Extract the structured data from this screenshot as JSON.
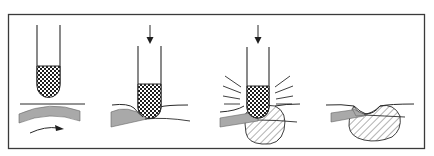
{
  "diagram": {
    "title": "Four-stage sequence of a tip approaching, pressing into and melting a layered surface",
    "frame": {
      "stroke": "#3a3a3a"
    },
    "colors": {
      "ink": "#2a2a2a",
      "layer_fill": "#a9a9a9",
      "checker_dark": "#1e1e1e",
      "checker_light": "#ffffff",
      "hatch": "#555555"
    },
    "panels": [
      {
        "id": "panel-1",
        "label": "Stage 1: tip above surface, layer flexing with flow arrow"
      },
      {
        "id": "panel-2",
        "label": "Stage 2: tip pressing down into surface"
      },
      {
        "id": "panel-3",
        "label": "Stage 3: tip pressing with radiating energy lines, melt zone hatched"
      },
      {
        "id": "panel-4",
        "label": "Stage 4: tip removed, hatched melt zone remains"
      }
    ],
    "icons": {
      "down_arrow": "down-arrow-icon",
      "flow_arrow": "flow-arrow-icon",
      "radiation_lines": "radiation-lines-icon"
    }
  }
}
